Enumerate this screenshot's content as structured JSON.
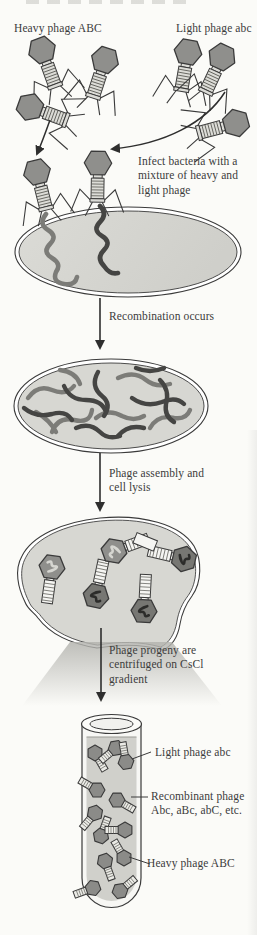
{
  "figure": {
    "top": {
      "heavy_label": "Heavy phage ABC",
      "light_label": "Light phage abc"
    },
    "steps": {
      "infect": "Infect bacteria with a mixture of heavy and light phage",
      "recombination": "Recombination occurs",
      "assembly": "Phage assembly and cell lysis",
      "centrifuge": "Phage progeny are centrifuged on CsCl gradient"
    },
    "tube_labels": {
      "light": "Light phage abc",
      "recombinant": "Recombinant phage Abc, aBc, abC, etc.",
      "heavy": "Heavy phage ABC"
    }
  },
  "colors": {
    "background": "#fbfbf8",
    "ink": "#3a3a3a",
    "text": "#3c3c3c",
    "phage_head": "#8f8f8c",
    "phage_head_dark": "#6f6f6c",
    "tail_light": "#dcdcd7",
    "tail_white": "#f5f5f2",
    "cell_fill": "#d7d7d2",
    "liquid_fill": "#d0d0cb",
    "dna_dark": "#454543",
    "dna_medium": "#7c7c78"
  }
}
